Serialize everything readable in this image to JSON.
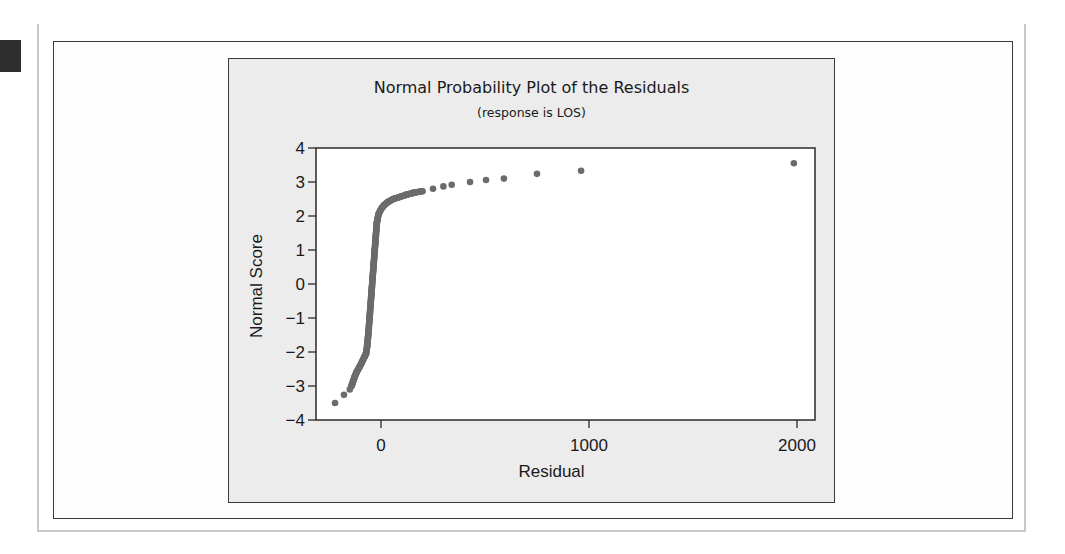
{
  "chart_data": {
    "type": "scatter",
    "title": "Normal Probability Plot of the Residuals",
    "subtitle": "(response is LOS)",
    "xlabel": "Residual",
    "ylabel": "Normal Score",
    "xlim": [
      -330,
      2090
    ],
    "ylim": [
      -4,
      4
    ],
    "xticks": [
      0,
      1000,
      2000
    ],
    "xtick_labels": [
      "0",
      "1000",
      "2000"
    ],
    "yticks": [
      4,
      3,
      2,
      1,
      0,
      -1,
      -2,
      -3,
      -4
    ],
    "ytick_labels": [
      "4",
      "3",
      "2",
      "1",
      "0",
      "−1",
      "−2",
      "−3",
      "−4"
    ],
    "grid": false,
    "legend": null,
    "marker_color": "#6b6b6b",
    "series": [
      {
        "name": "residuals",
        "points": [
          [
            -221,
            -3.5
          ],
          [
            -178,
            -3.26
          ],
          [
            -150,
            -3.1
          ],
          [
            -142,
            -3.0
          ],
          [
            -136,
            -2.9
          ],
          [
            -128,
            -2.75
          ],
          [
            -118,
            -2.6
          ],
          [
            -104,
            -2.45
          ],
          [
            -92,
            -2.3
          ],
          [
            -80,
            -2.15
          ],
          [
            -72,
            -2.05
          ],
          [
            -66,
            -1.8
          ],
          [
            -60,
            -1.4
          ],
          [
            -55,
            -1.0
          ],
          [
            -50,
            -0.6
          ],
          [
            -45,
            -0.2
          ],
          [
            -40,
            0.2
          ],
          [
            -35,
            0.6
          ],
          [
            -30,
            1.0
          ],
          [
            -25,
            1.4
          ],
          [
            -20,
            1.8
          ],
          [
            -12,
            2.05
          ],
          [
            0,
            2.2
          ],
          [
            15,
            2.32
          ],
          [
            35,
            2.42
          ],
          [
            60,
            2.5
          ],
          [
            90,
            2.56
          ],
          [
            120,
            2.62
          ],
          [
            155,
            2.68
          ],
          [
            200,
            2.73
          ],
          [
            250,
            2.8
          ],
          [
            300,
            2.87
          ],
          [
            340,
            2.92
          ],
          [
            428,
            3.0
          ],
          [
            505,
            3.06
          ],
          [
            591,
            3.1
          ],
          [
            750,
            3.24
          ],
          [
            962,
            3.33
          ],
          [
            1985,
            3.55
          ]
        ]
      }
    ]
  },
  "page": {
    "marker_block": "dark-square"
  }
}
